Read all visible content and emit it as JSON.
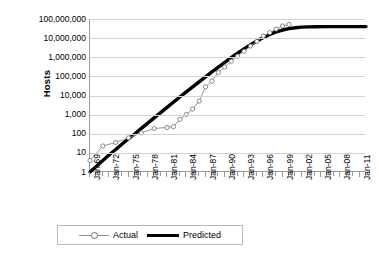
{
  "chart_data": {
    "type": "line",
    "title": "",
    "xlabel": "",
    "ylabel": "Hosts",
    "yscale": "log",
    "ylim": [
      1,
      100000000
    ],
    "y_ticks": [
      "1",
      "10",
      "100",
      "1,000",
      "10,000",
      "100,000",
      "1,000,000",
      "10,000,000",
      "100,000,000"
    ],
    "y_tick_values": [
      1,
      10,
      100,
      1000,
      10000,
      100000,
      1000000,
      10000000,
      100000000
    ],
    "x_tick_labels": [
      "Jan-69",
      "Jan-72",
      "Jan-75",
      "Jan-78",
      "Jan-81",
      "Jan-84",
      "Jan-87",
      "Jan-90",
      "Jan-93",
      "Jan-96",
      "Jan-99",
      "Jan-02",
      "Jan-05",
      "Jan-08",
      "Jan-11"
    ],
    "x_tick_years": [
      1969,
      1972,
      1975,
      1978,
      1981,
      1984,
      1987,
      1990,
      1993,
      1996,
      1999,
      2002,
      2005,
      2008,
      2011
    ],
    "xlim": [
      1969,
      2012
    ],
    "grid": "horizontal",
    "legend_position": "bottom-center",
    "series": [
      {
        "name": "Actual",
        "style": "thin-line-with-open-circle-markers",
        "color": "#8c8c8c",
        "marker_color": "#6e6e6e",
        "points": [
          {
            "x": 1969.0,
            "y": 4
          },
          {
            "x": 1971.0,
            "y": 23
          },
          {
            "x": 1973.0,
            "y": 35
          },
          {
            "x": 1975.0,
            "y": 61
          },
          {
            "x": 1977.0,
            "y": 111
          },
          {
            "x": 1979.0,
            "y": 188
          },
          {
            "x": 1981.0,
            "y": 213
          },
          {
            "x": 1982.0,
            "y": 235
          },
          {
            "x": 1983.0,
            "y": 562
          },
          {
            "x": 1984.0,
            "y": 1024
          },
          {
            "x": 1985.0,
            "y": 1961
          },
          {
            "x": 1986.0,
            "y": 5089
          },
          {
            "x": 1987.0,
            "y": 28174
          },
          {
            "x": 1988.0,
            "y": 56000
          },
          {
            "x": 1989.0,
            "y": 159000
          },
          {
            "x": 1990.0,
            "y": 313000
          },
          {
            "x": 1991.0,
            "y": 617000
          },
          {
            "x": 1992.0,
            "y": 1136000
          },
          {
            "x": 1993.0,
            "y": 2056000
          },
          {
            "x": 1994.0,
            "y": 3864000
          },
          {
            "x": 1995.0,
            "y": 6642000
          },
          {
            "x": 1996.0,
            "y": 12881000
          },
          {
            "x": 1997.0,
            "y": 19540000
          },
          {
            "x": 1998.0,
            "y": 29670000
          },
          {
            "x": 1999.0,
            "y": 43230000
          },
          {
            "x": 2000.0,
            "y": 52000000
          }
        ]
      },
      {
        "name": "Predicted",
        "style": "thick-solid-line",
        "color": "#000000",
        "description": "Logistic S-curve rising from 1 host at Jan-69 and saturating near 40,000,000 hosts after Jan-02",
        "saturation_value": 40000000,
        "points": [
          {
            "x": 1969.0,
            "y": 1
          },
          {
            "x": 1970.0,
            "y": 2
          },
          {
            "x": 1971.0,
            "y": 4
          },
          {
            "x": 1972.0,
            "y": 8
          },
          {
            "x": 1973.0,
            "y": 15
          },
          {
            "x": 1974.0,
            "y": 29
          },
          {
            "x": 1975.0,
            "y": 55
          },
          {
            "x": 1976.0,
            "y": 100
          },
          {
            "x": 1977.0,
            "y": 190
          },
          {
            "x": 1978.0,
            "y": 360
          },
          {
            "x": 1979.0,
            "y": 680
          },
          {
            "x": 1980.0,
            "y": 1280
          },
          {
            "x": 1981.0,
            "y": 2400
          },
          {
            "x": 1982.0,
            "y": 4500
          },
          {
            "x": 1983.0,
            "y": 8400
          },
          {
            "x": 1984.0,
            "y": 15500
          },
          {
            "x": 1985.0,
            "y": 28500
          },
          {
            "x": 1986.0,
            "y": 52000
          },
          {
            "x": 1987.0,
            "y": 95000
          },
          {
            "x": 1988.0,
            "y": 170000
          },
          {
            "x": 1989.0,
            "y": 305000
          },
          {
            "x": 1990.0,
            "y": 540000
          },
          {
            "x": 1991.0,
            "y": 950000
          },
          {
            "x": 1992.0,
            "y": 1630000
          },
          {
            "x": 1993.0,
            "y": 2750000
          },
          {
            "x": 1994.0,
            "y": 4500000
          },
          {
            "x": 1995.0,
            "y": 7100000
          },
          {
            "x": 1996.0,
            "y": 10800000
          },
          {
            "x": 1997.0,
            "y": 15600000
          },
          {
            "x": 1998.0,
            "y": 21000000
          },
          {
            "x": 1999.0,
            "y": 26500000
          },
          {
            "x": 2000.0,
            "y": 31500000
          },
          {
            "x": 2001.0,
            "y": 35000000
          },
          {
            "x": 2002.0,
            "y": 37500000
          },
          {
            "x": 2003.0,
            "y": 38800000
          },
          {
            "x": 2004.0,
            "y": 39400000
          },
          {
            "x": 2006.0,
            "y": 39800000
          },
          {
            "x": 2008.0,
            "y": 40000000
          },
          {
            "x": 2010.0,
            "y": 40000000
          },
          {
            "x": 2012.0,
            "y": 40000000
          }
        ]
      }
    ],
    "legend": [
      {
        "label": "Actual",
        "style": "thin-line-with-open-circle-markers"
      },
      {
        "label": "Predicted",
        "style": "thick-solid-line"
      }
    ]
  }
}
